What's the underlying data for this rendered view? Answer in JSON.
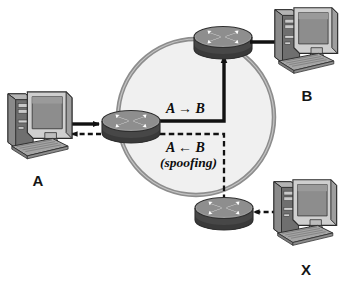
{
  "diagram": {
    "network_cloud": {
      "shape": "circle",
      "fill_color": "#f0f0f0",
      "border_color": "#8d8d8d"
    },
    "colors": {
      "router_top": "#9a9a9a",
      "router_body": "#4a4a4a",
      "router_arrow": "#ffffff",
      "monitor_bezel": "#d2d2d2",
      "monitor_screen": "#8f8f8f",
      "tower_case": "#7e7e7e",
      "keyboard": "#9c9c9c",
      "line_color": "#111111",
      "cloud_fill": "#f0f0f0",
      "cloud_border": "#8d8d8d"
    },
    "hosts": [
      {
        "id": "A",
        "label": "A",
        "role": "source-host"
      },
      {
        "id": "B",
        "label": "B",
        "role": "destination-host"
      },
      {
        "id": "X",
        "label": "X",
        "role": "attacker-host"
      }
    ],
    "routers": [
      {
        "id": "router-a",
        "attached_host": "A"
      },
      {
        "id": "router-b",
        "attached_host": "B"
      },
      {
        "id": "router-x",
        "attached_host": "X"
      }
    ],
    "flows": [
      {
        "id": "legit-flow",
        "label": "A → B",
        "sublabel": "",
        "style": "solid",
        "description": "Legitimate traffic from A to B"
      },
      {
        "id": "spoofed-flow",
        "label": "A ← B",
        "sublabel": "(spoofing)",
        "style": "dashed",
        "description": "Spoofed traffic appearing to come from B, sent by X"
      }
    ],
    "links": [
      {
        "id": "link-a-to-router",
        "style": "solid",
        "direction": "right"
      },
      {
        "id": "link-router-to-a",
        "style": "dashed",
        "direction": "left"
      },
      {
        "id": "link-router-to-b",
        "style": "solid",
        "direction": "right"
      },
      {
        "id": "link-x-to-router",
        "style": "dashed",
        "direction": "left"
      }
    ]
  }
}
